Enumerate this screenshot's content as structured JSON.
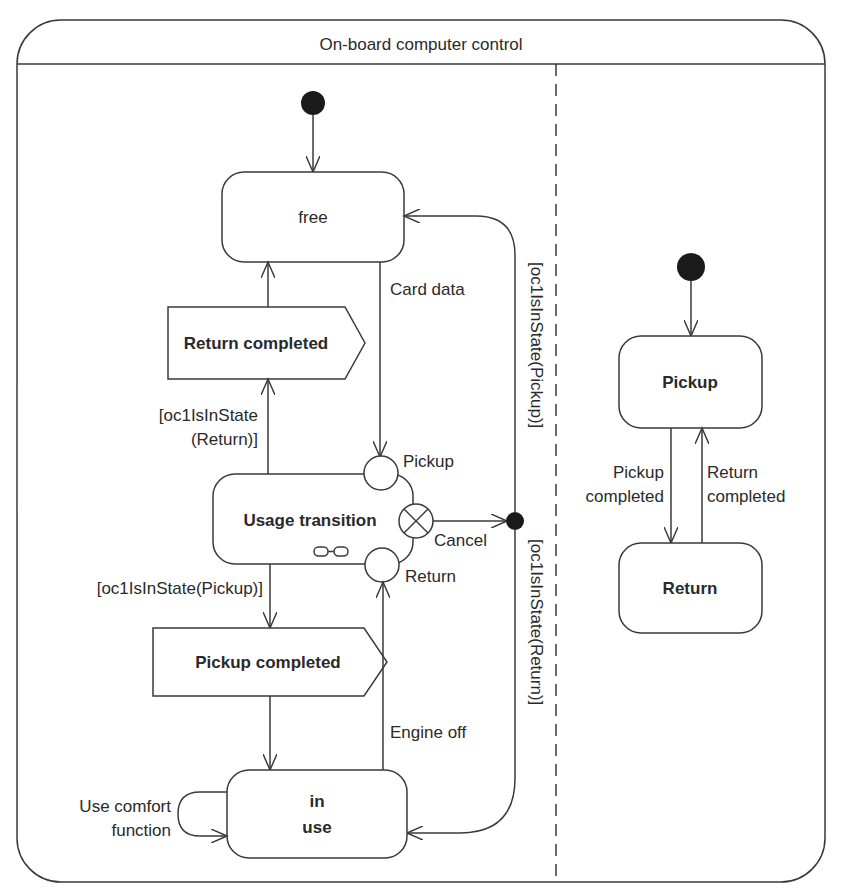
{
  "diagram": {
    "title": "On-board computer control",
    "colors": {
      "line": "#3a3a3a",
      "text": "#2a2a2a",
      "background": "#ffffff",
      "initial_node": "#1a1a1a"
    },
    "left_region": {
      "states": {
        "free": "free",
        "usage_transition": "Usage transition",
        "in_use_line1": "in",
        "in_use_line2": "use"
      },
      "signals": {
        "return_completed": "Return completed",
        "pickup_completed": "Pickup completed"
      },
      "entry_exit_points": {
        "pickup": "Pickup",
        "cancel": "Cancel",
        "return": "Return"
      },
      "transitions": {
        "card_data": "Card data",
        "engine_off": "Engine off",
        "guard_return_line1": "[oc1IsInState",
        "guard_return_line2": "(Return)]",
        "guard_pickup": "[oc1IsInState(Pickup)]",
        "guard_vertical_pickup": "[oc1IsInState(Pickup)]",
        "guard_vertical_return": "[oc1IsInState(Return)]",
        "use_comfort_line1": "Use comfort",
        "use_comfort_line2": "function"
      }
    },
    "right_region": {
      "states": {
        "pickup": "Pickup",
        "return": "Return"
      },
      "transitions": {
        "pickup_completed_line1": "Pickup",
        "pickup_completed_line2": "completed",
        "return_completed_line1": "Return",
        "return_completed_line2": "completed"
      }
    }
  }
}
